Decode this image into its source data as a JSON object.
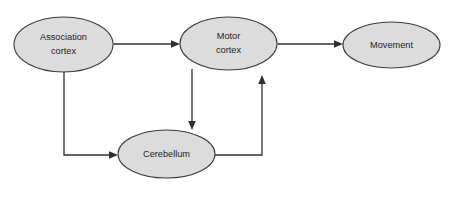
{
  "figure": {
    "background_color": "#ffffff",
    "node_fill_color": "#dcdcdc",
    "node_stroke_color": "#3a3a3a",
    "edge_color": "#2f2f2f"
  },
  "nodes": {
    "association_cortex": {
      "label_line1": "Association",
      "label_line2": "cortex",
      "cx": 63.5,
      "cy": 44.5,
      "rx": 49.5,
      "ry": 27.5
    },
    "motor_cortex": {
      "label_line1": "Motor",
      "label_line2": "cortex",
      "cx": 228.5,
      "cy": 43.5,
      "rx": 48.5,
      "ry": 26.5
    },
    "movement": {
      "label_line1": "Movement",
      "label_line2": "",
      "cx": 391.5,
      "cy": 45.0,
      "rx": 48.5,
      "ry": 23.0
    },
    "cerebellum": {
      "label_line1": "Cerebellum",
      "label_line2": "",
      "cx": 166.5,
      "cy": 154.0,
      "rx": 48.5,
      "ry": 24.0
    }
  },
  "edges": [
    {
      "name": "association-cortex-to-motor-cortex",
      "from": "association_cortex",
      "to": "motor_cortex",
      "path": "M 113.5 44 L 176 44",
      "arrow": "M 180 44 L 171 40.2 L 171 47.8 Z"
    },
    {
      "name": "motor-cortex-to-movement",
      "from": "motor_cortex",
      "to": "movement",
      "path": "M 277.5 44 L 339 44",
      "arrow": "M 343 44 L 334 40.2 L 334 47.8 Z"
    },
    {
      "name": "association-cortex-to-cerebellum",
      "from": "association_cortex",
      "to": "cerebellum",
      "path": "M 64 72 L 64 155 L 114 155",
      "arrow": "M 118 155 L 109 151.2 L 109 158.8 Z"
    },
    {
      "name": "motor-cortex-to-cerebellum",
      "from": "motor_cortex",
      "to": "cerebellum",
      "path": "M 192 69 L 192 126",
      "arrow": "M 192 130 L 188.2 121 L 195.8 121 Z"
    },
    {
      "name": "cerebellum-to-motor-cortex",
      "from": "cerebellum",
      "to": "motor_cortex",
      "path": "M 215 155 L 262 155 L 262 79",
      "arrow": "M 262 75 L 258.2 84 L 265.8 84 Z"
    }
  ]
}
